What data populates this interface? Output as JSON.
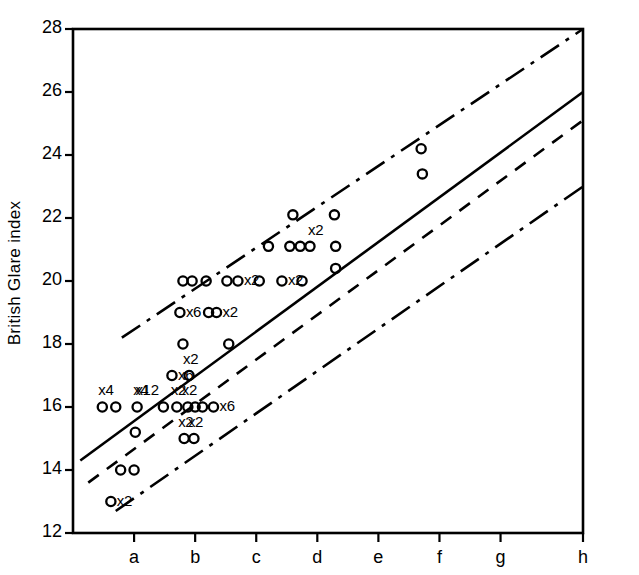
{
  "figure": {
    "background": "#ffffff",
    "ink": "#000000",
    "width": 639,
    "height": 575
  },
  "axes": {
    "y_axis_title": "British Glare index",
    "y_ticks": [
      12,
      14,
      16,
      18,
      20,
      22,
      24,
      26,
      28
    ],
    "y_tick_labels": [
      "12",
      "14",
      "16",
      "18",
      "20",
      "22",
      "24",
      "26",
      "28"
    ],
    "x_ticks": [
      "a",
      "b",
      "c",
      "d",
      "e",
      "f",
      "g",
      "h"
    ],
    "x_axis_title": "",
    "y_range": [
      12,
      28
    ],
    "x_range": [
      0,
      8.35
    ],
    "grid": false,
    "frame": "box"
  },
  "chart_data": {
    "type": "scatter",
    "title": "",
    "xlabel": "",
    "ylabel": "British Glare index",
    "ylim": [
      12,
      28
    ],
    "xlim": [
      0,
      8.35
    ],
    "xtick_labels": [
      "a",
      "b",
      "c",
      "d",
      "e",
      "f",
      "g",
      "h"
    ],
    "ytick_labels": [
      "12",
      "14",
      "16",
      "18",
      "20",
      "22",
      "24",
      "26",
      "28"
    ],
    "grid": false,
    "legend": "none",
    "marker": "open-circle",
    "note": "Multiplicity labels (xN) indicate N coincident observations at that point.",
    "points": [
      {
        "x": 0.48,
        "y": 16.0,
        "mult": 4,
        "mult_label": "x4"
      },
      {
        "x": 0.7,
        "y": 16.0,
        "mult": 1,
        "mult_label": ""
      },
      {
        "x": 1.05,
        "y": 16.0,
        "mult": 4,
        "mult_label": "x4"
      },
      {
        "x": 0.62,
        "y": 13.0,
        "mult": 2,
        "mult_label": "x2"
      },
      {
        "x": 0.78,
        "y": 14.0,
        "mult": 1,
        "mult_label": ""
      },
      {
        "x": 1.0,
        "y": 14.0,
        "mult": 1,
        "mult_label": ""
      },
      {
        "x": 1.02,
        "y": 15.2,
        "mult": 1,
        "mult_label": ""
      },
      {
        "x": 1.48,
        "y": 16.0,
        "mult": 12,
        "mult_label": "x12"
      },
      {
        "x": 1.62,
        "y": 17.0,
        "mult": 6,
        "mult_label": "x6"
      },
      {
        "x": 1.75,
        "y": 19.0,
        "mult": 6,
        "mult_label": "x6"
      },
      {
        "x": 1.8,
        "y": 18.0,
        "mult": 1,
        "mult_label": ""
      },
      {
        "x": 1.8,
        "y": 20.0,
        "mult": 1,
        "mult_label": ""
      },
      {
        "x": 1.95,
        "y": 20.0,
        "mult": 1,
        "mult_label": ""
      },
      {
        "x": 1.9,
        "y": 17.0,
        "mult": 2,
        "mult_label": "x2"
      },
      {
        "x": 1.7,
        "y": 16.0,
        "mult": 2,
        "mult_label": "x2"
      },
      {
        "x": 1.88,
        "y": 16.0,
        "mult": 2,
        "mult_label": "x2"
      },
      {
        "x": 2.0,
        "y": 16.0,
        "mult": 1,
        "mult_label": ""
      },
      {
        "x": 2.12,
        "y": 16.0,
        "mult": 1,
        "mult_label": ""
      },
      {
        "x": 1.82,
        "y": 15.0,
        "mult": 2,
        "mult_label": "x2"
      },
      {
        "x": 1.98,
        "y": 15.0,
        "mult": 2,
        "mult_label": "x2"
      },
      {
        "x": 2.18,
        "y": 20.0,
        "mult": 1,
        "mult_label": ""
      },
      {
        "x": 2.22,
        "y": 19.0,
        "mult": 1,
        "mult_label": ""
      },
      {
        "x": 2.35,
        "y": 19.0,
        "mult": 2,
        "mult_label": "x2"
      },
      {
        "x": 2.3,
        "y": 16.0,
        "mult": 6,
        "mult_label": "x6"
      },
      {
        "x": 2.52,
        "y": 20.0,
        "mult": 1,
        "mult_label": ""
      },
      {
        "x": 2.7,
        "y": 20.0,
        "mult": 2,
        "mult_label": "x2"
      },
      {
        "x": 2.55,
        "y": 18.0,
        "mult": 1,
        "mult_label": ""
      },
      {
        "x": 3.05,
        "y": 20.0,
        "mult": 1,
        "mult_label": ""
      },
      {
        "x": 3.2,
        "y": 21.1,
        "mult": 1,
        "mult_label": ""
      },
      {
        "x": 3.55,
        "y": 21.1,
        "mult": 1,
        "mult_label": ""
      },
      {
        "x": 3.72,
        "y": 21.1,
        "mult": 1,
        "mult_label": ""
      },
      {
        "x": 3.88,
        "y": 21.1,
        "mult": 2,
        "mult_label": "x2"
      },
      {
        "x": 3.6,
        "y": 22.1,
        "mult": 1,
        "mult_label": ""
      },
      {
        "x": 3.42,
        "y": 20.0,
        "mult": 2,
        "mult_label": "x2"
      },
      {
        "x": 3.75,
        "y": 20.0,
        "mult": 1,
        "mult_label": ""
      },
      {
        "x": 4.3,
        "y": 21.1,
        "mult": 1,
        "mult_label": ""
      },
      {
        "x": 4.28,
        "y": 22.1,
        "mult": 1,
        "mult_label": ""
      },
      {
        "x": 4.3,
        "y": 20.4,
        "mult": 1,
        "mult_label": ""
      },
      {
        "x": 5.7,
        "y": 24.2,
        "mult": 1,
        "mult_label": ""
      },
      {
        "x": 5.72,
        "y": 23.4,
        "mult": 1,
        "mult_label": ""
      }
    ],
    "lines": [
      {
        "name": "upper-limit",
        "style": "dash-dot",
        "x": [
          0.8,
          8.35
        ],
        "y": [
          18.2,
          28.0
        ]
      },
      {
        "name": "best-fit",
        "style": "solid",
        "x": [
          0.12,
          8.35
        ],
        "y": [
          14.3,
          26.0
        ]
      },
      {
        "name": "secondary-fit",
        "style": "dashed",
        "x": [
          0.25,
          8.35
        ],
        "y": [
          13.6,
          25.1
        ]
      },
      {
        "name": "lower-limit",
        "style": "dash-dot",
        "x": [
          0.7,
          8.35
        ],
        "y": [
          12.7,
          23.0
        ]
      }
    ]
  }
}
